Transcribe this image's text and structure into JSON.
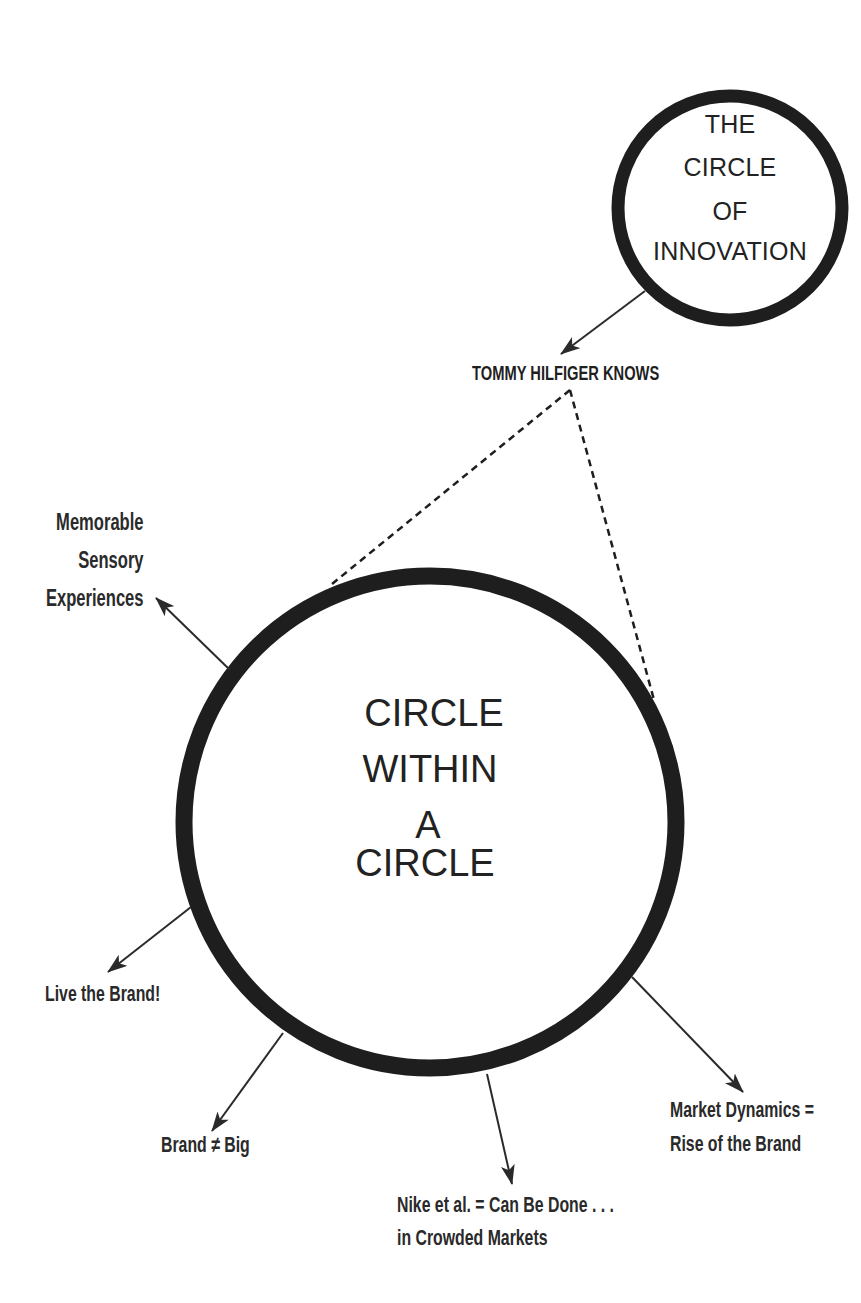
{
  "diagram": {
    "small_circle": {
      "title_lines": [
        "THE",
        "CIRCLE",
        "OF",
        "INNOVATION"
      ],
      "center": [
        730,
        208
      ],
      "radius": 112,
      "stroke_width": 13
    },
    "big_circle": {
      "title_lines": [
        "CIRCLE",
        "WITHIN",
        "A",
        "CIRCLE"
      ],
      "center": [
        430,
        822
      ],
      "radius": 246,
      "stroke_width": 17
    },
    "connector_label": "TOMMY HILFIGER KNOWS",
    "branches": [
      {
        "id": "memorable",
        "lines": [
          "Memorable",
          "Sensory",
          "Experiences"
        ]
      },
      {
        "id": "live",
        "lines": [
          "Live the Brand!"
        ]
      },
      {
        "id": "brand-big",
        "lines": [
          "Brand ≠ Big"
        ]
      },
      {
        "id": "nike",
        "lines": [
          "Nike et al. = Can Be Done . . .",
          "in Crowded Markets"
        ]
      },
      {
        "id": "market",
        "lines": [
          "Market Dynamics =",
          "Rise of the Brand"
        ]
      }
    ],
    "colors": {
      "ink": "#1e1e1e",
      "text": "#2a2a2a",
      "background": "#ffffff"
    }
  }
}
